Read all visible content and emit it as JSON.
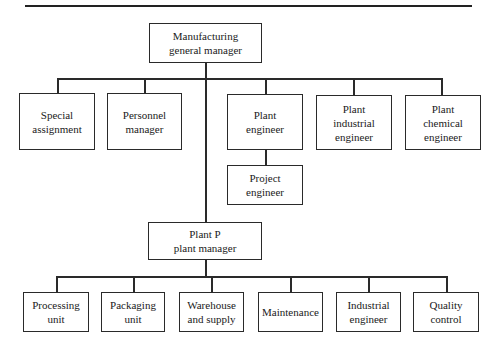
{
  "diagram": {
    "type": "organization-chart",
    "top": {
      "label": "Manufacturing\ngeneral manager"
    },
    "staff": [
      {
        "label": "Special\nassignment"
      },
      {
        "label": "Personnel\nmanager"
      },
      {
        "label": "Plant\nengineer"
      },
      {
        "label": "Plant\nindustrial\nengineer"
      },
      {
        "label": "Plant\nchemical\nengineer"
      }
    ],
    "sub_of_plant_engineer": {
      "label": "Project\nengineer"
    },
    "plant_manager": {
      "label": "Plant P\nplant manager"
    },
    "departments": [
      {
        "label": "Processing\nunit"
      },
      {
        "label": "Packaging\nunit"
      },
      {
        "label": "Warehouse\nand supply"
      },
      {
        "label": "Maintenance"
      },
      {
        "label": "Industrial\nengineer"
      },
      {
        "label": "Quality\ncontrol"
      }
    ],
    "edges": [
      [
        "Manufacturing general manager",
        "Special assignment"
      ],
      [
        "Manufacturing general manager",
        "Personnel manager"
      ],
      [
        "Manufacturing general manager",
        "Plant engineer"
      ],
      [
        "Manufacturing general manager",
        "Plant industrial engineer"
      ],
      [
        "Manufacturing general manager",
        "Plant chemical engineer"
      ],
      [
        "Plant engineer",
        "Project engineer"
      ],
      [
        "Manufacturing general manager",
        "Plant P plant manager"
      ],
      [
        "Plant P plant manager",
        "Processing unit"
      ],
      [
        "Plant P plant manager",
        "Packaging unit"
      ],
      [
        "Plant P plant manager",
        "Warehouse and supply"
      ],
      [
        "Plant P plant manager",
        "Maintenance"
      ],
      [
        "Plant P plant manager",
        "Industrial engineer"
      ],
      [
        "Plant P plant manager",
        "Quality control"
      ]
    ]
  }
}
